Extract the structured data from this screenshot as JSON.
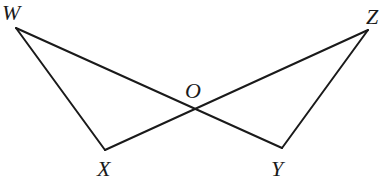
{
  "diagram": {
    "type": "geometry",
    "points": {
      "W": {
        "label": "W",
        "x": 16,
        "y": 28
      },
      "Z": {
        "label": "Z",
        "x": 368,
        "y": 30
      },
      "X": {
        "label": "X",
        "x": 105,
        "y": 150
      },
      "Y": {
        "label": "Y",
        "x": 282,
        "y": 148
      },
      "O": {
        "label": "O",
        "x": 192,
        "y": 107
      }
    },
    "segments": [
      {
        "from": "W",
        "to": "Y"
      },
      {
        "from": "X",
        "to": "Z"
      },
      {
        "from": "W",
        "to": "X"
      },
      {
        "from": "Z",
        "to": "Y"
      }
    ],
    "labels": {
      "W": "W",
      "Z": "Z",
      "O": "O",
      "X": "X",
      "Y": "Y"
    }
  }
}
